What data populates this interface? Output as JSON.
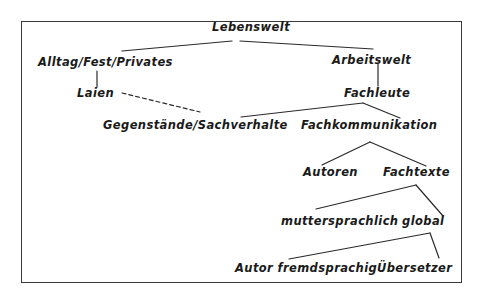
{
  "diagram": {
    "type": "tree",
    "line_color": "#2a2a2a",
    "text_color": "#1a1a1a",
    "nodes": {
      "lebenswelt": "Lebenswelt",
      "alltag": "Alltag/Fest/Privates",
      "arbeitswelt": "Arbeitswelt",
      "laien": "Laien",
      "fachleute": "Fachleute",
      "gegenstaende": "Gegenstände/Sachverhalte",
      "fachkommunikation": "Fachkommunikation",
      "autoren": "Autoren",
      "fachtexte": "Fachtexte",
      "muttersprachlich": "muttersprachlich",
      "global": "global",
      "autor_fremdsprachig": "Autor fremdsprachig",
      "uebersetzer": "Übersetzer"
    },
    "edges": [
      {
        "from": "Lebenswelt",
        "to": "Alltag/Fest/Privates",
        "style": "solid"
      },
      {
        "from": "Lebenswelt",
        "to": "Arbeitswelt",
        "style": "solid"
      },
      {
        "from": "Alltag/Fest/Privates",
        "to": "Laien",
        "style": "solid"
      },
      {
        "from": "Arbeitswelt",
        "to": "Fachleute",
        "style": "solid"
      },
      {
        "from": "Laien",
        "to": "Gegenstände/Sachverhalte",
        "style": "dashed"
      },
      {
        "from": "Fachleute",
        "to": "Gegenstände/Sachverhalte",
        "style": "solid"
      },
      {
        "from": "Fachleute",
        "to": "Fachkommunikation",
        "style": "solid"
      },
      {
        "from": "Fachkommunikation",
        "to": "Autoren",
        "style": "solid"
      },
      {
        "from": "Fachkommunikation",
        "to": "Fachtexte",
        "style": "solid"
      },
      {
        "from": "Fachtexte",
        "to": "muttersprachlich",
        "style": "solid"
      },
      {
        "from": "Fachtexte",
        "to": "global",
        "style": "solid"
      },
      {
        "from": "global",
        "to": "Autor fremdsprachig",
        "style": "solid"
      },
      {
        "from": "global",
        "to": "Übersetzer",
        "style": "solid"
      }
    ]
  }
}
